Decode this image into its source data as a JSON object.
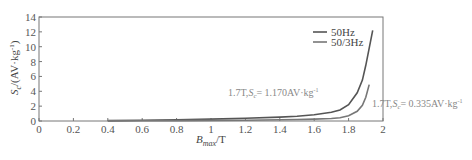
{
  "chart_data": {
    "type": "line",
    "title": "",
    "xlabel": "B_max/T",
    "ylabel": "S_c/(AV·kg⁻¹)",
    "xlim": [
      0,
      2
    ],
    "ylim": [
      0,
      14
    ],
    "xticks": [
      "0",
      "0.2",
      "0.4",
      "0.6",
      "0.8",
      "1",
      "1.2",
      "1.4",
      "1.6",
      "1.8",
      "2"
    ],
    "yticks": [
      "0",
      "2",
      "4",
      "6",
      "8",
      "10",
      "12",
      "14"
    ],
    "grid": false,
    "legend_position": "upper right",
    "series": [
      {
        "name": "50Hz",
        "color": "#555555",
        "x": [
          0.4,
          0.6,
          0.8,
          1.0,
          1.2,
          1.4,
          1.5,
          1.6,
          1.7,
          1.75,
          1.8,
          1.85,
          1.88,
          1.9,
          1.92,
          1.94
        ],
        "y": [
          0.05,
          0.1,
          0.17,
          0.25,
          0.36,
          0.52,
          0.65,
          0.85,
          1.17,
          1.5,
          2.2,
          3.8,
          5.5,
          7.5,
          9.8,
          12.2
        ]
      },
      {
        "name": "50/3Hz",
        "color": "#777777",
        "x": [
          0.4,
          0.6,
          0.8,
          1.0,
          1.2,
          1.4,
          1.5,
          1.6,
          1.7,
          1.75,
          1.8,
          1.85,
          1.88,
          1.9,
          1.92
        ],
        "y": [
          0.02,
          0.03,
          0.05,
          0.08,
          0.11,
          0.16,
          0.2,
          0.26,
          0.335,
          0.45,
          0.7,
          1.3,
          2.1,
          3.2,
          4.9
        ]
      }
    ],
    "annotations": [
      {
        "text_prefix": "1.7T,",
        "var": "S",
        "sub": "c",
        "text_suffix": "= 1.170AV·kg",
        "sup": "-1",
        "series": "50Hz"
      },
      {
        "text_prefix": "1.7T,",
        "var": "S",
        "sub": "c",
        "text_suffix": "= 0.335AV·kg",
        "sup": "-1",
        "series": "50/3Hz"
      }
    ]
  },
  "axes": {
    "ylabel_main": "S",
    "ylabel_sub": "c",
    "ylabel_rest": "/(AV·kg",
    "ylabel_sup": "-1",
    "ylabel_close": ")",
    "xlabel_main": "B",
    "xlabel_sub": "max",
    "xlabel_rest": "/T"
  },
  "legend": {
    "items": [
      "50Hz",
      "50/3Hz"
    ]
  }
}
